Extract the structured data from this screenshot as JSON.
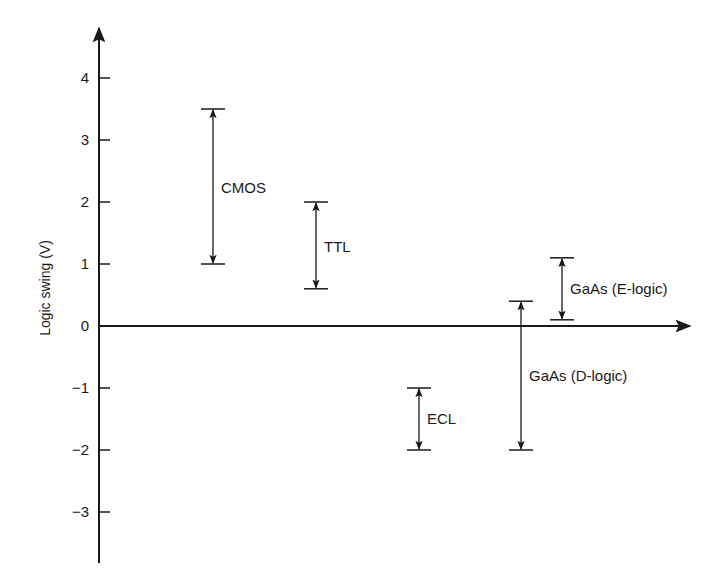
{
  "chart_data": {
    "type": "range",
    "title": "",
    "xlabel": "",
    "ylabel": "Logic swing (V)",
    "ylim": [
      -3.8,
      4.8
    ],
    "yticks": [
      4,
      3,
      2,
      1,
      0,
      -1,
      -2,
      -3
    ],
    "ytick_labels": [
      "4",
      "3",
      "2",
      "1",
      "0",
      "−1",
      "−2",
      "−3"
    ],
    "grid": false,
    "legend": null,
    "series": [
      {
        "name": "CMOS",
        "low": 1.0,
        "high": 3.5
      },
      {
        "name": "TTL",
        "low": 0.6,
        "high": 2.0
      },
      {
        "name": "ECL",
        "low": -2.0,
        "high": -1.0
      },
      {
        "name": "GaAs (D-logic)",
        "low": -2.0,
        "high": 0.4
      },
      {
        "name": "GaAs (E-logic)",
        "low": 0.1,
        "high": 1.1
      }
    ]
  },
  "colors": {
    "ink": "#1a1a1a",
    "background": "#ffffff"
  },
  "layout": {
    "axis_x": 99,
    "zero_y": 326,
    "px_per_volt": 62,
    "y_axis_top": 28,
    "y_axis_bottom": 563,
    "x_axis_end": 690,
    "series_x": [
      213,
      316,
      419,
      521,
      562
    ],
    "label_offset": [
      [
        8,
        0
      ],
      [
        8,
        0
      ],
      [
        8,
        0
      ],
      [
        8,
        0
      ],
      [
        8,
        0
      ]
    ],
    "label_y": [
      188,
      247,
      419,
      376,
      289
    ]
  }
}
